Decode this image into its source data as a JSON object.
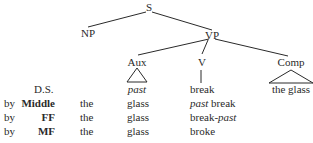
{
  "tree": {
    "root": "S",
    "np": "NP",
    "vp": "VP",
    "aux": "Aux",
    "v": "V",
    "comp": "Comp",
    "aux_leaf": "past",
    "v_leaf": "break",
    "comp_leaf": "the glass"
  },
  "derivation": {
    "ds_label": "D.S.",
    "rows": [
      {
        "by": "by",
        "rule": "Middle",
        "det": "the",
        "noun": "glass",
        "v_pre": "past",
        "v_main": " break",
        "v_suffix": ""
      },
      {
        "by": "by",
        "rule": "FF",
        "det": "the",
        "noun": "glass",
        "v_pre": "",
        "v_main": "break-",
        "v_suffix": "past"
      },
      {
        "by": "by",
        "rule": "MF",
        "det": "the",
        "noun": "glass",
        "v_pre": "",
        "v_main": "broke",
        "v_suffix": ""
      }
    ]
  },
  "colors": {
    "ink": "#2a2a2a"
  }
}
